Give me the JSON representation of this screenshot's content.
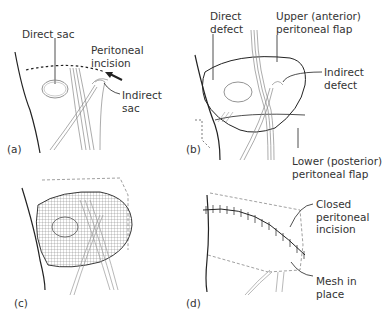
{
  "figure": {
    "panels": [
      {
        "id": "a",
        "label": "(a)",
        "annotations": {
          "direct_sac": "Direct sac",
          "peritoneal_incision": "Peritoneal\nincision",
          "indirect_sac": "Indirect\nsac"
        }
      },
      {
        "id": "b",
        "label": "(b)",
        "annotations": {
          "direct_defect": "Direct\ndefect",
          "upper_flap": "Upper (anterior)\nperitoneal flap",
          "indirect_defect": "Indirect\ndefect",
          "lower_flap": "Lower (posterior)\nperitoneal flap"
        }
      },
      {
        "id": "c",
        "label": "(c)",
        "annotations": {}
      },
      {
        "id": "d",
        "label": "(d)",
        "annotations": {
          "closed_incision": "Closed\nperitoneal\nincision",
          "mesh_in_place": "Mesh in\nplace"
        }
      }
    ],
    "colors": {
      "line": "#222222",
      "light_line": "#888888",
      "text": "#333333"
    }
  }
}
